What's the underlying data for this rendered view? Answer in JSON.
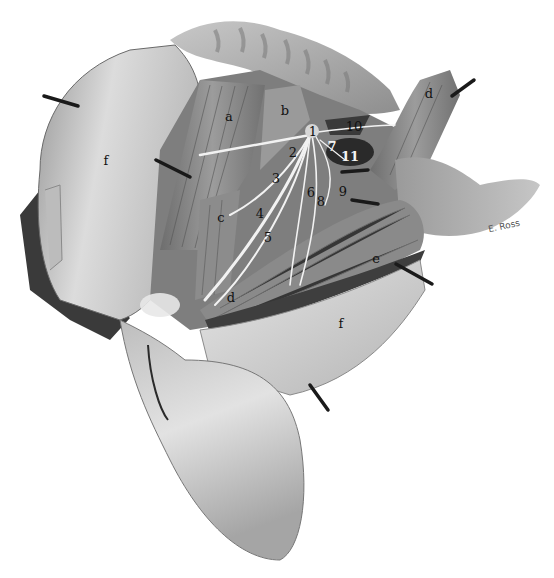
{
  "figure": {
    "type": "anatomical-illustration",
    "style": "grayscale",
    "signature": "E. Ross",
    "colors": {
      "background": "#ffffff",
      "skin_light": "#d9d9d9",
      "skin_mid": "#a8a8a8",
      "muscle": "#8a8a8a",
      "muscle_dark": "#5c5c5c",
      "shadow": "#2e2e2e",
      "nerve": "#f2f2f2",
      "pin": "#1a1a1a"
    }
  },
  "letter_labels": [
    {
      "id": "a",
      "text": "a",
      "x": 229,
      "y": 116
    },
    {
      "id": "b",
      "text": "b",
      "x": 285,
      "y": 110
    },
    {
      "id": "c",
      "text": "c",
      "x": 221,
      "y": 217
    },
    {
      "id": "d-top",
      "text": "d",
      "x": 429,
      "y": 93
    },
    {
      "id": "d-bottom",
      "text": "d",
      "x": 231,
      "y": 297
    },
    {
      "id": "e",
      "text": "e",
      "x": 376,
      "y": 258
    },
    {
      "id": "f-left",
      "text": "f",
      "x": 106,
      "y": 160
    },
    {
      "id": "f-bottom",
      "text": "f",
      "x": 341,
      "y": 323
    }
  ],
  "number_labels": [
    {
      "id": "1",
      "text": "1",
      "x": 313,
      "y": 131,
      "style": "dark"
    },
    {
      "id": "2",
      "text": "2",
      "x": 293,
      "y": 152,
      "style": "dark"
    },
    {
      "id": "3",
      "text": "3",
      "x": 276,
      "y": 178,
      "style": "dark"
    },
    {
      "id": "4",
      "text": "4",
      "x": 260,
      "y": 213,
      "style": "dark"
    },
    {
      "id": "5",
      "text": "5",
      "x": 268,
      "y": 237,
      "style": "dark"
    },
    {
      "id": "6",
      "text": "6",
      "x": 311,
      "y": 192,
      "style": "dark"
    },
    {
      "id": "7",
      "text": "7",
      "x": 332,
      "y": 146,
      "style": "light"
    },
    {
      "id": "8",
      "text": "8",
      "x": 321,
      "y": 201,
      "style": "dark"
    },
    {
      "id": "9",
      "text": "9",
      "x": 343,
      "y": 191,
      "style": "dark"
    },
    {
      "id": "10",
      "text": "10",
      "x": 354,
      "y": 126,
      "style": "dark"
    },
    {
      "id": "11",
      "text": "11",
      "x": 350,
      "y": 156,
      "style": "light"
    }
  ],
  "pins": [
    {
      "id": "pin-left-top",
      "x1": 44,
      "y1": 96,
      "x2": 80,
      "y2": 106
    },
    {
      "id": "pin-left-mid",
      "x1": 156,
      "y1": 160,
      "x2": 190,
      "y2": 178
    },
    {
      "id": "pin-d-top",
      "x1": 450,
      "y1": 98,
      "x2": 475,
      "y2": 80
    },
    {
      "id": "pin-right-1",
      "x1": 340,
      "y1": 173,
      "x2": 368,
      "y2": 169
    },
    {
      "id": "pin-right-2",
      "x1": 352,
      "y1": 200,
      "x2": 378,
      "y2": 204
    },
    {
      "id": "pin-e",
      "x1": 396,
      "y1": 265,
      "x2": 432,
      "y2": 285
    },
    {
      "id": "pin-bottom",
      "x1": 305,
      "y1": 380,
      "x2": 330,
      "y2": 410
    },
    {
      "id": "pin-lower-left",
      "x1": 150,
      "y1": 340,
      "x2": 165,
      "y2": 420
    }
  ]
}
